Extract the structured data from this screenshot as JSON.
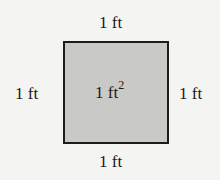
{
  "diagram": {
    "type": "square-area",
    "fill_color": "#c9c9c7",
    "border_color": "#1c1c1c",
    "labels": {
      "top": "1 ft",
      "bottom": "1 ft",
      "left": "1 ft",
      "right": "1 ft"
    },
    "area": {
      "value": "1 ft",
      "exponent": "2"
    }
  }
}
